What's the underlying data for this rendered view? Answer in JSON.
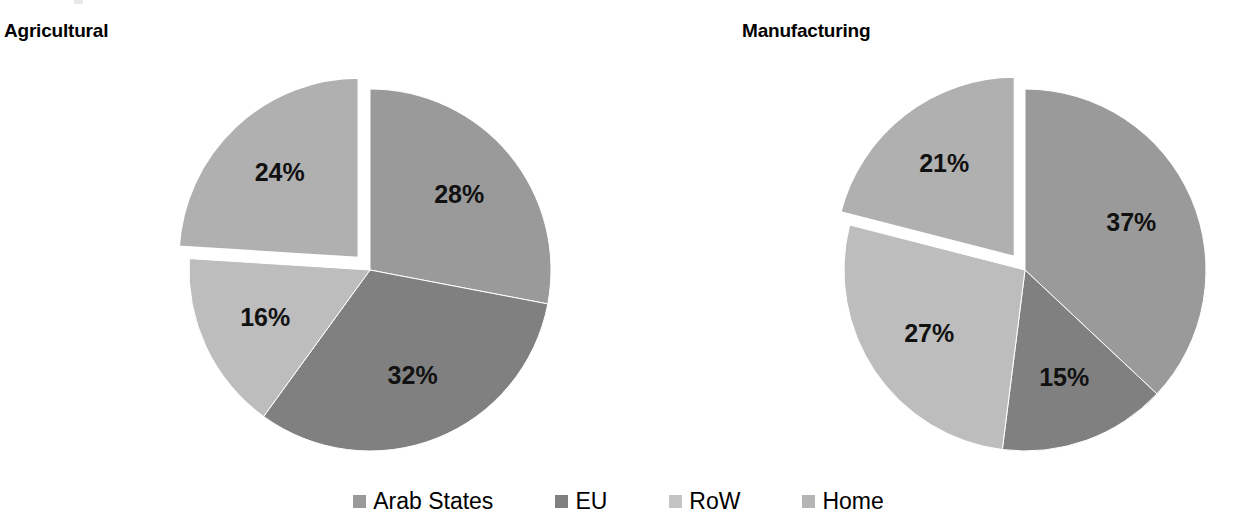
{
  "charts": [
    {
      "title": "Agricultural",
      "type": "pie",
      "center": {
        "x": 370,
        "y": 270
      },
      "radius": 181,
      "start_angle_deg": 0,
      "labels": [
        "28%",
        "32%",
        "16%",
        "24%"
      ],
      "chart_data": {
        "type": "pie",
        "title": "Agricultural",
        "categories": [
          "Arab States",
          "EU",
          "RoW",
          "Home"
        ],
        "values": [
          28,
          32,
          16,
          24
        ],
        "value_labels": [
          "28%",
          "32%",
          "16%",
          "24%"
        ],
        "units": "percent",
        "exploded_slice": "Home",
        "legend_position": "bottom",
        "grid": false
      }
    },
    {
      "title": "Manufacturing",
      "type": "pie",
      "center": {
        "x": 1025,
        "y": 270
      },
      "radius": 181,
      "start_angle_deg": 0,
      "labels": [
        "37%",
        "15%",
        "27%",
        "21%"
      ],
      "chart_data": {
        "type": "pie",
        "title": "Manufacturing",
        "categories": [
          "Arab States",
          "EU",
          "RoW",
          "Home"
        ],
        "values": [
          37,
          15,
          27,
          21
        ],
        "value_labels": [
          "37%",
          "15%",
          "27%",
          "21%"
        ],
        "units": "percent",
        "exploded_slice": "Home",
        "legend_position": "bottom",
        "grid": false
      }
    }
  ],
  "chart_data": [
    {
      "type": "pie",
      "title": "Agricultural",
      "categories": [
        "Arab States",
        "EU",
        "RoW",
        "Home"
      ],
      "values": [
        28,
        32,
        16,
        24
      ],
      "value_labels": [
        "28%",
        "32%",
        "16%",
        "24%"
      ],
      "colors": [
        "#9a9a9a",
        "#808080",
        "#bdbdbd",
        "#b0b0b0"
      ],
      "units": "percent",
      "exploded_slice": "Home",
      "legend_position": "bottom",
      "grid": false
    },
    {
      "type": "pie",
      "title": "Manufacturing",
      "categories": [
        "Arab States",
        "EU",
        "RoW",
        "Home"
      ],
      "values": [
        37,
        15,
        27,
        21
      ],
      "value_labels": [
        "37%",
        "15%",
        "27%",
        "21%"
      ],
      "colors": [
        "#9a9a9a",
        "#808080",
        "#bdbdbd",
        "#b0b0b0"
      ],
      "units": "percent",
      "exploded_slice": "Home",
      "legend_position": "bottom",
      "grid": false
    }
  ],
  "legend": {
    "items": [
      {
        "label": "Arab States",
        "color": "#9a9a9a"
      },
      {
        "label": "EU",
        "color": "#808080"
      },
      {
        "label": "RoW",
        "color": "#c4c4c4"
      },
      {
        "label": "Home",
        "color": "#b5b5b5"
      }
    ]
  },
  "colors": {
    "arab_states": "#9a9a9a",
    "eu": "#808080",
    "row": "#bdbdbd",
    "home": "#b0b0b0",
    "background": "#ffffff",
    "text": "#000000"
  }
}
